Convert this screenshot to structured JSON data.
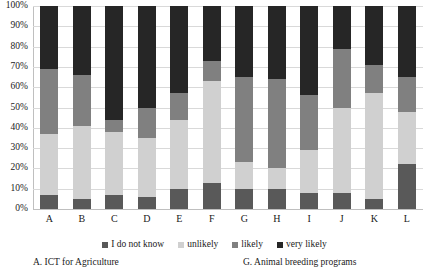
{
  "axes": {
    "y_ticks": [
      "0%",
      "10%",
      "20%",
      "30%",
      "40%",
      "50%",
      "60%",
      "70%",
      "80%",
      "90%",
      "100%"
    ]
  },
  "legend": {
    "items": [
      {
        "label": "I do not know",
        "color": "#595959"
      },
      {
        "label": "unlikely",
        "color": "#d0d0d0"
      },
      {
        "label": "likely",
        "color": "#808080"
      },
      {
        "label": "very likely",
        "color": "#262626"
      }
    ]
  },
  "footnotes": {
    "left": "A. ICT for Agriculture",
    "right": "G. Animal breeding programs"
  },
  "chart_data": {
    "type": "bar",
    "title": "",
    "xlabel": "",
    "ylabel": "",
    "ylim": [
      0,
      100
    ],
    "grid": true,
    "stacked": true,
    "stack_total": 100,
    "legend_position": "bottom",
    "categories": [
      "A",
      "B",
      "C",
      "D",
      "E",
      "F",
      "G",
      "H",
      "I",
      "J",
      "K",
      "L"
    ],
    "series": [
      {
        "name": "I do not know",
        "color": "#595959",
        "values": [
          7,
          5,
          7,
          6,
          10,
          13,
          10,
          10,
          8,
          8,
          5,
          22
        ]
      },
      {
        "name": "unlikely",
        "color": "#d0d0d0",
        "values": [
          30,
          36,
          31,
          29,
          34,
          50,
          13,
          10,
          21,
          42,
          52,
          26
        ]
      },
      {
        "name": "likely",
        "color": "#808080",
        "values": [
          32,
          25,
          6,
          15,
          13,
          10,
          42,
          44,
          27,
          29,
          14,
          17
        ]
      },
      {
        "name": "very likely",
        "color": "#262626",
        "values": [
          31,
          34,
          56,
          50,
          43,
          27,
          35,
          36,
          44,
          21,
          29,
          35
        ]
      }
    ]
  }
}
